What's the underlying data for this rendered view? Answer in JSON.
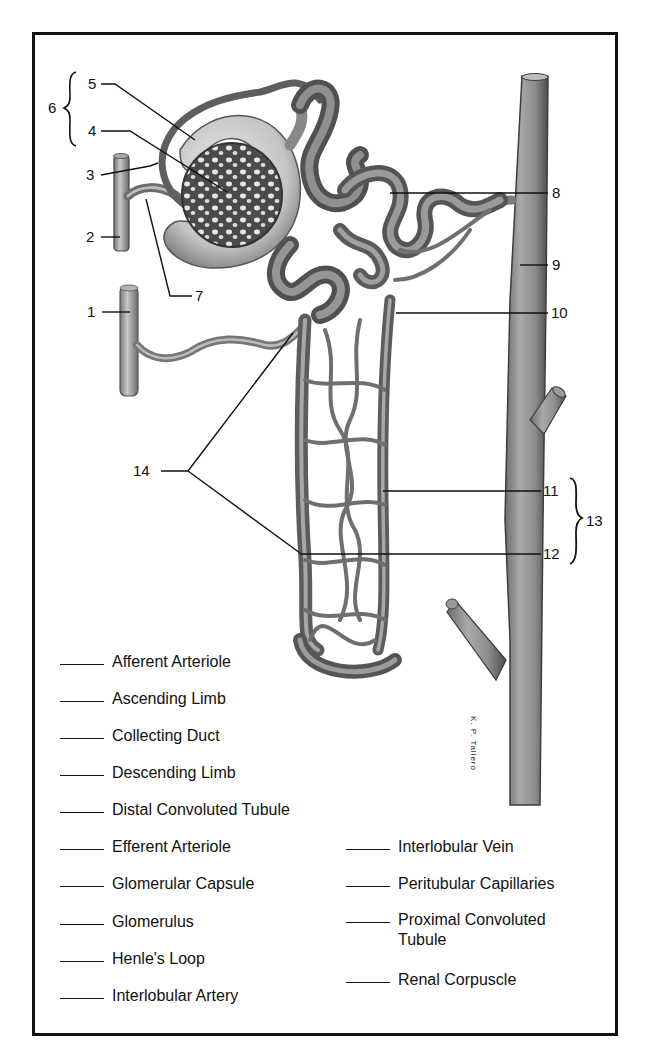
{
  "diagram": {
    "signature": "K. P. Tallero",
    "callouts": [
      {
        "id": "1",
        "label": "1"
      },
      {
        "id": "2",
        "label": "2"
      },
      {
        "id": "3",
        "label": "3"
      },
      {
        "id": "4",
        "label": "4"
      },
      {
        "id": "5",
        "label": "5"
      },
      {
        "id": "6",
        "label": "6"
      },
      {
        "id": "7",
        "label": "7"
      },
      {
        "id": "8",
        "label": "8"
      },
      {
        "id": "9",
        "label": "9"
      },
      {
        "id": "10",
        "label": "10"
      },
      {
        "id": "11",
        "label": "11"
      },
      {
        "id": "12",
        "label": "12"
      },
      {
        "id": "13",
        "label": "13"
      },
      {
        "id": "14",
        "label": "14"
      }
    ]
  },
  "legend": {
    "left_column": [
      {
        "label": "Afferent Arteriole",
        "answer": ""
      },
      {
        "label": "Ascending Limb",
        "answer": ""
      },
      {
        "label": "Collecting Duct",
        "answer": ""
      },
      {
        "label": "Descending Limb",
        "answer": ""
      },
      {
        "label": "Distal Convoluted Tubule",
        "answer": ""
      },
      {
        "label": "Efferent Arteriole",
        "answer": ""
      },
      {
        "label": "Glomerular Capsule",
        "answer": ""
      },
      {
        "label": "Glomerulus",
        "answer": ""
      },
      {
        "label": "Henle's Loop",
        "answer": ""
      },
      {
        "label": "Interlobular Artery",
        "answer": ""
      }
    ],
    "right_column": [
      {
        "label": "Interlobular Vein",
        "answer": ""
      },
      {
        "label": "Peritubular Capillaries",
        "answer": ""
      },
      {
        "label": "Proximal Convoluted Tubule",
        "label_line1": "Proximal Convoluted",
        "label_line2": "Tubule",
        "answer": ""
      },
      {
        "label": "Renal Corpuscle",
        "answer": ""
      }
    ]
  },
  "colors": {
    "frame": "#111111",
    "vessel_dark": "#555555",
    "vessel_mid": "#8a8a8a",
    "vessel_light": "#c9c9c9",
    "background": "#ffffff"
  }
}
